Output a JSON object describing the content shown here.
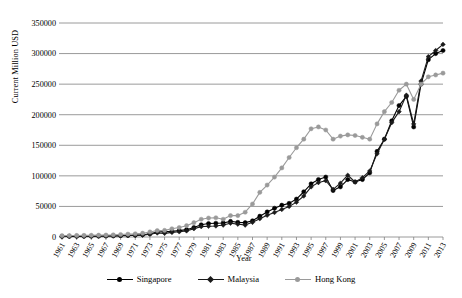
{
  "chart_data": {
    "type": "line",
    "title": "",
    "xlabel": "Year",
    "ylabel": "Current Million USD",
    "ylim": [
      0,
      350000
    ],
    "ytick_step": 50000,
    "yticks": [
      "0",
      "50000",
      "100000",
      "150000",
      "200000",
      "250000",
      "300000",
      "350000"
    ],
    "grid": "horizontal",
    "legend_position": "bottom",
    "x_start": 1961,
    "x_end": 2013,
    "xtick_step": 2,
    "x": [
      1961,
      1962,
      1963,
      1964,
      1965,
      1966,
      1967,
      1968,
      1969,
      1970,
      1971,
      1972,
      1973,
      1974,
      1975,
      1976,
      1977,
      1978,
      1979,
      1980,
      1981,
      1982,
      1983,
      1984,
      1985,
      1986,
      1987,
      1988,
      1989,
      1990,
      1991,
      1992,
      1993,
      1994,
      1995,
      1996,
      1997,
      1998,
      1999,
      2000,
      2001,
      2002,
      2003,
      2004,
      2005,
      2006,
      2007,
      2008,
      2009,
      2010,
      2011,
      2012,
      2013
    ],
    "xticks": [
      "1961",
      "1963",
      "1965",
      "1967",
      "1969",
      "1971",
      "1973",
      "1975",
      "1977",
      "1979",
      "1981",
      "1983",
      "1985",
      "1987",
      "1989",
      "1991",
      "1993",
      "1995",
      "1997",
      "1999",
      "2001",
      "2003",
      "2005",
      "2007",
      "2009",
      "2011",
      "2013"
    ],
    "series": [
      {
        "name": "Singapore",
        "color": "#000000",
        "marker": "circle",
        "values": [
          950,
          1000,
          1100,
          1150,
          1250,
          1400,
          1600,
          1850,
          2150,
          2500,
          3000,
          3700,
          5200,
          8200,
          8800,
          9500,
          10500,
          12000,
          15500,
          20000,
          22000,
          22500,
          23000,
          25500,
          24000,
          23500,
          26500,
          34000,
          41000,
          47000,
          52000,
          55000,
          62000,
          74000,
          87000,
          94000,
          98000,
          76000,
          82000,
          94000,
          90000,
          94000,
          105000,
          140000,
          160000,
          190000,
          215000,
          230000,
          180000,
          250000,
          290000,
          300000,
          305000
        ]
      },
      {
        "name": "Malaysia",
        "color": "#1a1a1a",
        "marker": "diamond",
        "values": [
          1100,
          1150,
          1200,
          1250,
          1350,
          1500,
          1600,
          1800,
          2100,
          2400,
          2600,
          3000,
          4500,
          6500,
          6000,
          7500,
          8500,
          10000,
          13500,
          17000,
          17500,
          18000,
          19500,
          22500,
          21000,
          19500,
          24000,
          30000,
          35500,
          40000,
          45000,
          50000,
          57000,
          67000,
          82000,
          89000,
          92000,
          78000,
          88000,
          101000,
          90000,
          97000,
          108000,
          136000,
          160000,
          187000,
          205000,
          232000,
          185000,
          255000,
          295000,
          305000,
          315000
        ]
      },
      {
        "name": "Hong Kong",
        "color": "#9a9a9a",
        "marker": "circle",
        "values": [
          2200,
          2350,
          2500,
          2650,
          2800,
          3000,
          3200,
          3500,
          4100,
          4700,
          5300,
          6200,
          8300,
          10500,
          10800,
          13500,
          15500,
          18500,
          23500,
          29000,
          31000,
          31500,
          29000,
          35000,
          35000,
          40500,
          54000,
          73000,
          85000,
          98000,
          113000,
          130000,
          146000,
          160000,
          177000,
          180000,
          175000,
          160000,
          165000,
          167000,
          166000,
          163000,
          160000,
          185000,
          205000,
          220000,
          240000,
          250000,
          225000,
          250000,
          262000,
          265000,
          268000
        ]
      }
    ]
  },
  "axes": {
    "ylabel": "Current Million USD",
    "xlabel": "Year"
  },
  "legend": {
    "items": [
      {
        "label": "Singapore",
        "color": "#000000",
        "marker": "circle"
      },
      {
        "label": "Malaysia",
        "color": "#1a1a1a",
        "marker": "diamond"
      },
      {
        "label": "Hong Kong",
        "color": "#9a9a9a",
        "marker": "circle"
      }
    ]
  }
}
